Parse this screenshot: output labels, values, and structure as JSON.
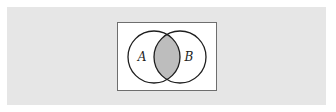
{
  "diagram": {
    "type": "venn",
    "sets": [
      {
        "id": "A",
        "label": "A",
        "cx": 154,
        "cy": 57,
        "r": 26
      },
      {
        "id": "B",
        "label": "B",
        "cx": 180,
        "cy": 57,
        "r": 26
      }
    ],
    "shaded_region": "A ∩ B",
    "colors": {
      "background_band": "#e6e6e6",
      "figure_background": "#ffffff",
      "figure_border": "#6e6e6e",
      "circle_stroke": "#1e1e1e",
      "intersection_fill": "#bdbdbd"
    }
  }
}
